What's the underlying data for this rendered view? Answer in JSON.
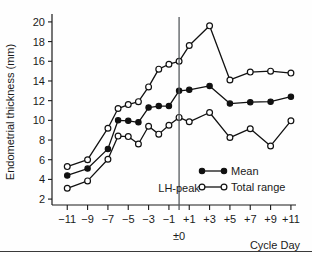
{
  "chart_data": {
    "type": "line",
    "title": "",
    "xlabel": "Cycle Day",
    "ylabel": "Endometrial thickness (mm)",
    "x": [
      -12,
      -11,
      -10,
      -9,
      -8,
      -7,
      -6,
      -5,
      -4,
      -3,
      -2,
      -1,
      0,
      1,
      2,
      3,
      4,
      5,
      6,
      7,
      8,
      9,
      10,
      11
    ],
    "xlim": [
      -12.5,
      11.5
    ],
    "ylim": [
      1.4,
      20.6
    ],
    "xticks": [
      -11,
      -9,
      -7,
      -5,
      -3,
      -1,
      1,
      3,
      5,
      7,
      9,
      11
    ],
    "xticklabels": [
      "−11",
      "−9",
      "−7",
      "−5",
      "−3",
      "−1",
      "+1",
      "+3",
      "+5",
      "+7",
      "+9",
      "+11"
    ],
    "yticks": [
      2,
      4,
      6,
      8,
      10,
      12,
      14,
      16,
      18,
      20
    ],
    "yticklabels": [
      "2",
      "4",
      "6",
      "8",
      "10",
      "12",
      "14",
      "16",
      "18",
      "20"
    ],
    "grid": false,
    "legend_position": "lower-right",
    "series": [
      {
        "name": "Total range",
        "role": "upper",
        "marker": "open-circle",
        "x": [
          -11,
          -9,
          -7,
          -6,
          -5,
          -4,
          -3,
          -2,
          -1,
          0,
          1,
          3,
          5,
          7,
          9,
          11
        ],
        "values": [
          5.3,
          6.0,
          9.2,
          11.2,
          11.6,
          11.9,
          13.4,
          15.2,
          15.7,
          16.0,
          17.6,
          19.6,
          14.1,
          14.9,
          15.0,
          14.8
        ]
      },
      {
        "name": "Mean",
        "role": "mean",
        "marker": "filled-circle",
        "x": [
          -11,
          -9,
          -7,
          -6,
          -5,
          -4,
          -3,
          -2,
          -1,
          0,
          1,
          3,
          5,
          7,
          9,
          11
        ],
        "values": [
          4.4,
          5.1,
          7.1,
          10.0,
          9.95,
          9.8,
          11.3,
          11.45,
          11.45,
          13.0,
          13.1,
          13.5,
          11.7,
          11.85,
          11.9,
          12.4
        ]
      },
      {
        "name": "Total range",
        "role": "lower",
        "marker": "open-circle",
        "x": [
          -11,
          -9,
          -7,
          -6,
          -5,
          -4,
          -3,
          -2,
          -1,
          0,
          1,
          3,
          5,
          7,
          9,
          11
        ],
        "values": [
          3.1,
          3.85,
          6.05,
          8.4,
          8.35,
          7.6,
          9.4,
          8.6,
          9.5,
          10.3,
          9.85,
          10.8,
          8.25,
          9.15,
          7.4,
          9.95
        ]
      }
    ],
    "annotations": [
      {
        "text": "LH-peak",
        "x": 0,
        "y": 2.7,
        "name": "lh-peak-annotation"
      },
      {
        "text": "±0",
        "x": 0,
        "y": -1,
        "name": "zero-day-label"
      }
    ],
    "vertical_line": {
      "x": 0,
      "color": "#555a5e",
      "name": "lh-peak-line"
    },
    "legend": [
      {
        "label": "Mean",
        "marker": "filled-circle"
      },
      {
        "label": "Total range",
        "marker": "open-circle"
      }
    ]
  }
}
